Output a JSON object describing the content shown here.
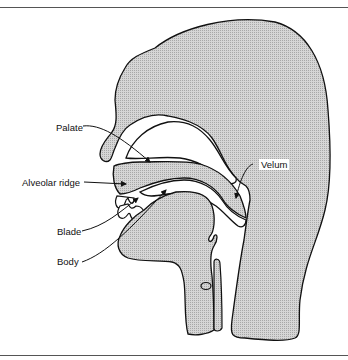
{
  "figure": {
    "labels": {
      "palate": "Palate",
      "alveolar_ridge": "Alveolar ridge",
      "blade": "Blade",
      "body": "Body",
      "velum": "Velum"
    },
    "colors": {
      "tissue_fill": "#c8c8c8",
      "outline": "#111111",
      "background": "#ffffff"
    }
  }
}
